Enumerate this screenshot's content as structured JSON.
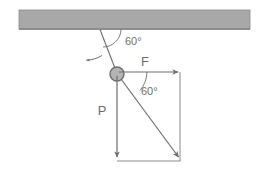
{
  "figure": {
    "name": "pendulum-force-vector-diagram",
    "title": "",
    "background_color": "#ffffff",
    "stroke_color": "#808080",
    "text_color": "#6e6e6e",
    "ceiling": {
      "name": "ceiling-support",
      "fill_color": "#a8a8a8",
      "edge_color": "#6e6e6e",
      "x": 19,
      "y": 10,
      "width": 231,
      "height": 19
    },
    "string": {
      "name": "suspension-string",
      "from": {
        "x": 100,
        "y": 30
      },
      "to": {
        "x": 117,
        "y": 74
      }
    },
    "swing_arrow": {
      "name": "swing-direction-arrow",
      "from": {
        "x": 100,
        "y": 57
      },
      "to": {
        "x": 85,
        "y": 60
      }
    },
    "ball": {
      "name": "pendulum-ball",
      "cx": 117,
      "cy": 74,
      "r": 7,
      "fill_color": "#b0b0b0",
      "edge_color": "#6e6e6e"
    },
    "angles": [
      {
        "name": "ceiling-string-angle",
        "value": "60°",
        "label_x": 125,
        "label_y": 44
      },
      {
        "name": "force-resultant-angle",
        "value": "60°",
        "label_x": 140,
        "label_y": 94
      }
    ],
    "vectors": [
      {
        "name": "force-vector-F",
        "label": "F",
        "label_x": 145,
        "label_y": 65,
        "from": {
          "x": 117,
          "y": 72
        },
        "to": {
          "x": 180,
          "y": 72
        }
      },
      {
        "name": "weight-vector-P",
        "label": "P",
        "label_x": 100,
        "label_y": 114,
        "from": {
          "x": 117,
          "y": 74
        },
        "to": {
          "x": 117,
          "y": 160
        }
      },
      {
        "name": "resultant-vector",
        "label": "",
        "label_x": 0,
        "label_y": 0,
        "from": {
          "x": 120,
          "y": 79
        },
        "to": {
          "x": 180,
          "y": 160
        }
      }
    ],
    "parallelogram": {
      "name": "force-parallelogram",
      "right_edge": {
        "x1": 180,
        "y1": 72,
        "x2": 180,
        "y2": 161
      },
      "bottom_edge": {
        "x1": 117,
        "y1": 161,
        "x2": 180,
        "y2": 161
      }
    }
  }
}
